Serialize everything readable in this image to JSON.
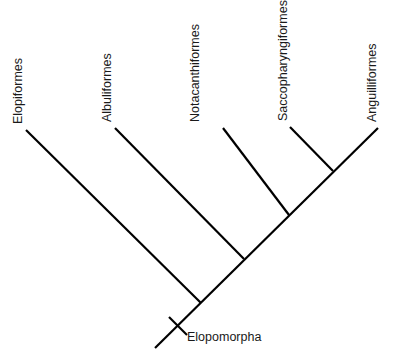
{
  "diagram": {
    "type": "cladogram",
    "clade": {
      "name": "Elopomorpha",
      "label_position": {
        "x": 187,
        "y": 341
      },
      "synapomorphy_tick": {
        "x1": 169,
        "y1": 317,
        "x2": 187,
        "y2": 335
      }
    },
    "root": {
      "x": 155,
      "y": 348
    },
    "spine_end": {
      "x": 378,
      "y": 128
    },
    "taxa": [
      {
        "name": "Elopiformes",
        "tip": {
          "x": 26,
          "y": 130
        },
        "node": {
          "x": 201,
          "y": 303
        },
        "label": {
          "x": 22,
          "y": 124
        }
      },
      {
        "name": "Albuliformes",
        "tip": {
          "x": 115,
          "y": 128
        },
        "node": {
          "x": 244,
          "y": 259
        },
        "label": {
          "x": 111,
          "y": 122
        }
      },
      {
        "name": "Notacanthiformes",
        "tip": {
          "x": 223,
          "y": 128
        },
        "node": {
          "x": 289,
          "y": 215
        },
        "label": {
          "x": 199,
          "y": 122
        }
      },
      {
        "name": "Saccopharyngiformes",
        "tip": {
          "x": 290,
          "y": 127
        },
        "node": {
          "x": 333,
          "y": 171
        },
        "label": {
          "x": 287,
          "y": 121
        }
      },
      {
        "name": "Anguilliformes",
        "tip": {
          "x": 378,
          "y": 128
        },
        "node": {
          "x": 333,
          "y": 171
        },
        "label": {
          "x": 376,
          "y": 122
        }
      }
    ],
    "line_color": "#000000",
    "text_color": "#1a1a1a",
    "background": "#ffffff"
  }
}
